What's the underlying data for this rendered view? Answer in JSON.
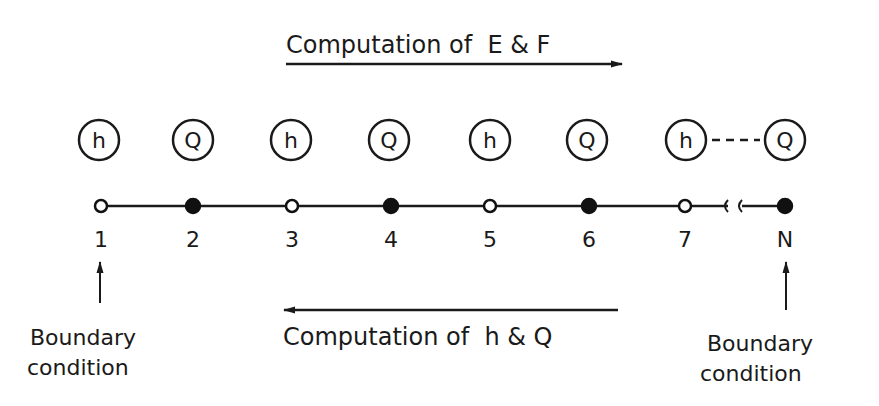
{
  "top_arrow": {
    "label": "Computation of  E & F",
    "direction": "right"
  },
  "bottom_arrow": {
    "label": "Computation of  h & Q",
    "direction": "left"
  },
  "variables": [
    "h",
    "Q",
    "h",
    "Q",
    "h",
    "Q",
    "h",
    "Q"
  ],
  "nodes": [
    {
      "label": "1",
      "type": "open"
    },
    {
      "label": "2",
      "type": "filled"
    },
    {
      "label": "3",
      "type": "open"
    },
    {
      "label": "4",
      "type": "filled"
    },
    {
      "label": "5",
      "type": "open"
    },
    {
      "label": "6",
      "type": "filled"
    },
    {
      "label": "7",
      "type": "open"
    },
    {
      "label": "N",
      "type": "filled"
    }
  ],
  "left_boundary": {
    "line1": "Boundary",
    "line2": "condition"
  },
  "right_boundary": {
    "line1": "Boundary",
    "line2": "condition"
  }
}
